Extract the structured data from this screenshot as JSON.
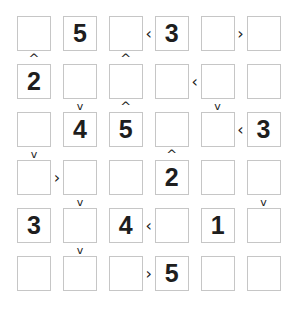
{
  "puzzle": {
    "type": "futoshiki",
    "size": 6,
    "grid": [
      [
        "",
        "5",
        "",
        "3",
        "",
        ""
      ],
      [
        "2",
        "",
        "",
        "",
        "",
        ""
      ],
      [
        "",
        "4",
        "5",
        "",
        "",
        "3"
      ],
      [
        "",
        "",
        "",
        "2",
        "",
        ""
      ],
      [
        "3",
        "",
        "4",
        "",
        "1",
        ""
      ],
      [
        "",
        "",
        "",
        "5",
        "",
        ""
      ]
    ],
    "horizontal_constraints": [
      {
        "row": 0,
        "col": 2,
        "sign": "<"
      },
      {
        "row": 0,
        "col": 4,
        "sign": ">"
      },
      {
        "row": 1,
        "col": 3,
        "sign": "<"
      },
      {
        "row": 2,
        "col": 4,
        "sign": "<"
      },
      {
        "row": 3,
        "col": 0,
        "sign": ">"
      },
      {
        "row": 4,
        "col": 2,
        "sign": "<"
      },
      {
        "row": 5,
        "col": 2,
        "sign": ">"
      }
    ],
    "vertical_constraints": [
      {
        "row": 0,
        "col": 0,
        "sign": "^"
      },
      {
        "row": 0,
        "col": 2,
        "sign": "^"
      },
      {
        "row": 1,
        "col": 1,
        "sign": "v"
      },
      {
        "row": 1,
        "col": 2,
        "sign": "^"
      },
      {
        "row": 1,
        "col": 4,
        "sign": "v"
      },
      {
        "row": 2,
        "col": 0,
        "sign": "v"
      },
      {
        "row": 2,
        "col": 3,
        "sign": "^"
      },
      {
        "row": 3,
        "col": 1,
        "sign": "v"
      },
      {
        "row": 3,
        "col": 5,
        "sign": "v"
      },
      {
        "row": 4,
        "col": 1,
        "sign": "v"
      }
    ]
  },
  "colors": {
    "cell_border": "#c6c6c6",
    "digit": "#1e1e1e"
  }
}
